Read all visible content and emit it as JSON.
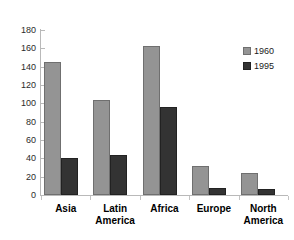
{
  "chart_data": {
    "type": "bar",
    "title": "",
    "subtitle": "",
    "xlabel": "",
    "ylabel": "",
    "ylim": [
      0,
      180
    ],
    "yticks": [
      0,
      20,
      40,
      60,
      80,
      100,
      120,
      140,
      160,
      180
    ],
    "grid": false,
    "legend_position": "top-right",
    "categories": [
      "Asia",
      "Latin America",
      "Africa",
      "Europe",
      "North America"
    ],
    "series": [
      {
        "name": "1960",
        "color": "#949494",
        "values": [
          145,
          104,
          163,
          32,
          24
        ]
      },
      {
        "name": "1995",
        "color": "#333333",
        "values": [
          40,
          44,
          96,
          8,
          7
        ]
      }
    ]
  },
  "axis": {
    "y_tick_labels": [
      "180",
      "160",
      "140",
      "120",
      "100",
      "80",
      "60",
      "40",
      "20",
      "0"
    ]
  },
  "categories_display": [
    {
      "line1": "Asia",
      "line2": ""
    },
    {
      "line1": "Latin",
      "line2": "America"
    },
    {
      "line1": "Africa",
      "line2": ""
    },
    {
      "line1": "Europe",
      "line2": ""
    },
    {
      "line1": "North",
      "line2": "America"
    }
  ],
  "legend": {
    "items": [
      {
        "label": "1960"
      },
      {
        "label": "1995"
      }
    ]
  },
  "colors": {
    "series_1960": "#949494",
    "series_1995": "#333333",
    "axis": "#b9b9b9",
    "background": "#ffffff",
    "text": "#000000"
  }
}
